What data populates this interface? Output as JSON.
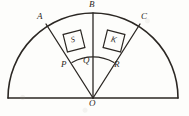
{
  "figure": {
    "stroke_color": "#2b2723",
    "background_color": "#fdfdfb",
    "center_label": "O",
    "points": [
      {
        "id": "A",
        "label": "A",
        "x": 46,
        "y": 23,
        "label_x": 37,
        "label_y": 13
      },
      {
        "id": "B",
        "label": "B",
        "x": 93,
        "y": 12,
        "label_x": 89,
        "label_y": 1
      },
      {
        "id": "C",
        "label": "C",
        "x": 140,
        "y": 23,
        "label_x": 141,
        "label_y": 13
      },
      {
        "id": "P",
        "label": "P",
        "x": 73,
        "y": 62,
        "label_x": 62,
        "label_y": 62
      },
      {
        "id": "Q",
        "label": "Q",
        "x": 93,
        "y": 57,
        "label_x": 83,
        "label_y": 58
      },
      {
        "id": "R",
        "label": "R",
        "x": 113,
        "y": 62,
        "label_x": 114,
        "label_y": 62
      },
      {
        "id": "O",
        "label": "O",
        "x": 93,
        "y": 98,
        "label_x": 89,
        "label_y": 100
      }
    ],
    "squares": [
      {
        "id": "S",
        "label": "S",
        "cx": 74,
        "cy": 41,
        "size": 18,
        "rotation": -14
      },
      {
        "id": "K",
        "label": "K",
        "cx": 114,
        "cy": 41,
        "size": 18,
        "rotation": 14
      }
    ],
    "arcs": {
      "outer_radius": 86,
      "inner_radius": 42
    },
    "rays": [
      "O-A",
      "O-B",
      "O-C"
    ]
  }
}
